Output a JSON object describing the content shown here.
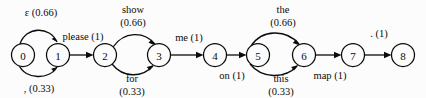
{
  "diagram": {
    "type": "weighted-finite-state-transducer",
    "title": "",
    "background_color": "#fcfcfc",
    "stroke_color": "#0b0b0b",
    "node_fill": "#fcfcfc",
    "states": [
      {
        "id": "0",
        "label": "0",
        "cx": 23,
        "cy": 55,
        "r": 11.5
      },
      {
        "id": "1",
        "label": "1",
        "cx": 58,
        "cy": 55,
        "r": 11.5
      },
      {
        "id": "2",
        "label": "2",
        "cx": 105,
        "cy": 55,
        "r": 11.5
      },
      {
        "id": "3",
        "label": "3",
        "cx": 159,
        "cy": 55,
        "r": 11.5
      },
      {
        "id": "4",
        "label": "4",
        "cx": 215,
        "cy": 55,
        "r": 11.5
      },
      {
        "id": "5",
        "label": "5",
        "cx": 258,
        "cy": 55,
        "r": 11.5
      },
      {
        "id": "6",
        "label": "6",
        "cx": 304,
        "cy": 55,
        "r": 11.5
      },
      {
        "id": "7",
        "label": "7",
        "cx": 353,
        "cy": 55,
        "r": 11.5
      },
      {
        "id": "8",
        "label": "8",
        "cx": 403,
        "cy": 55,
        "r": 11.5
      }
    ],
    "transitions": [
      {
        "id": "t0",
        "from": "0",
        "to": "1",
        "symbol": "ε",
        "weight": "0.66",
        "label": "ε (0.66)",
        "label_lines": [
          "ε (0.66)"
        ],
        "shape": "arc-above",
        "label_x": 41,
        "label_y": 12
      },
      {
        "id": "t1",
        "from": "0",
        "to": "1",
        "symbol": ",",
        "weight": "0.33",
        "label": ", (0.33)",
        "label_lines": [
          ", (0.33)"
        ],
        "shape": "arc-below",
        "label_x": 39,
        "label_y": 88
      },
      {
        "id": "t2",
        "from": "1",
        "to": "2",
        "symbol": "please",
        "weight": "1",
        "label": "please (1)",
        "label_lines": [
          "please (1)"
        ],
        "shape": "straight",
        "label_x": 83,
        "label_y": 36
      },
      {
        "id": "t3",
        "from": "2",
        "to": "3",
        "symbol": "show",
        "weight": "0.66",
        "label": "show (0.66)",
        "label_lines": [
          "show",
          "(0.66)"
        ],
        "shape": "arc-above",
        "label_x": 133,
        "label_y": 14
      },
      {
        "id": "t4",
        "from": "2",
        "to": "3",
        "symbol": "for",
        "weight": "0.33",
        "label": "for (0.33)",
        "label_lines": [
          "for",
          "(0.33)"
        ],
        "shape": "arc-below",
        "label_x": 132,
        "label_y": 78
      },
      {
        "id": "t5",
        "from": "3",
        "to": "4",
        "symbol": "me",
        "weight": "1",
        "label": "me (1)",
        "label_lines": [
          "me (1)"
        ],
        "shape": "straight",
        "label_x": 189,
        "label_y": 37
      },
      {
        "id": "t6",
        "from": "4",
        "to": "5",
        "symbol": "on",
        "weight": "1",
        "label": "on (1)",
        "label_lines": [
          "on (1)"
        ],
        "shape": "straight",
        "label_x": 232,
        "label_y": 75
      },
      {
        "id": "t7",
        "from": "5",
        "to": "6",
        "symbol": "the",
        "weight": "0.66",
        "label": "the (0.66)",
        "label_lines": [
          "the",
          "(0.66)"
        ],
        "shape": "arc-above",
        "label_x": 283,
        "label_y": 14
      },
      {
        "id": "t8",
        "from": "5",
        "to": "6",
        "symbol": "this",
        "weight": "0.33",
        "label": "this (0.33)",
        "label_lines": [
          "this",
          "(0.33)"
        ],
        "shape": "arc-below",
        "label_x": 281,
        "label_y": 78
      },
      {
        "id": "t9",
        "from": "6",
        "to": "7",
        "symbol": "map",
        "weight": "1",
        "label": "map (1)",
        "label_lines": [
          "map (1)"
        ],
        "shape": "straight",
        "label_x": 330,
        "label_y": 75
      },
      {
        "id": "t10",
        "from": "7",
        "to": "8",
        "symbol": ".",
        "weight": "1",
        "label": ". (1)",
        "label_lines": [
          ". (1)"
        ],
        "shape": "straight",
        "label_x": 379,
        "label_y": 33
      }
    ]
  }
}
